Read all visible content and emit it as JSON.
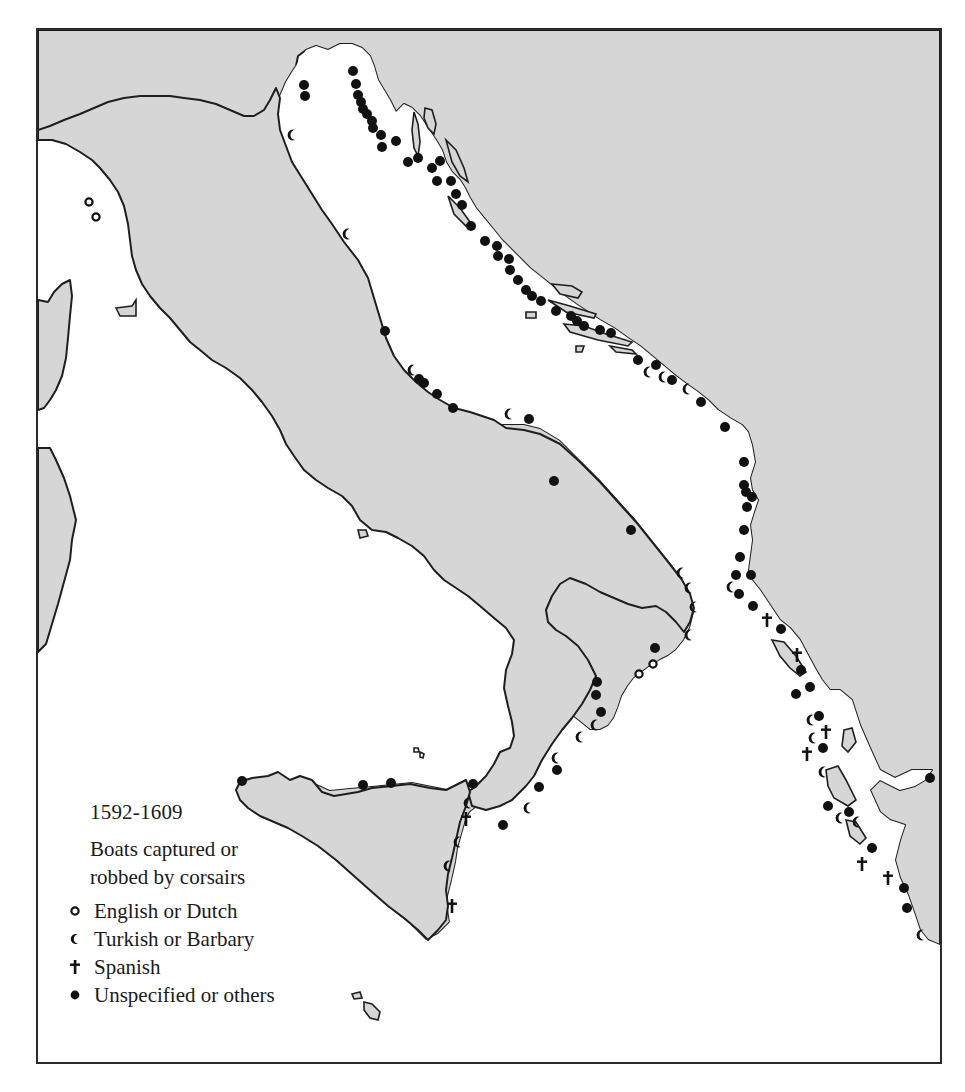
{
  "map": {
    "period": "1592-1609",
    "title_line1": "Boats captured or",
    "title_line2": "robbed by corsairs",
    "colors": {
      "land": "#d6d6d6",
      "sea": "#ffffff",
      "coast": "#1e1e1e",
      "symbol": "#111111"
    }
  },
  "legend": {
    "items": [
      {
        "symbol": "open-circle",
        "label": "English or Dutch"
      },
      {
        "symbol": "crescent",
        "label": "Turkish or Barbary"
      },
      {
        "symbol": "cross",
        "label": "Spanish"
      },
      {
        "symbol": "filled-circle",
        "label": "Unspecified or others"
      }
    ]
  },
  "markers": {
    "english_dutch": [
      [
        89,
        202
      ],
      [
        96,
        217
      ],
      [
        653,
        664
      ],
      [
        639,
        674
      ]
    ],
    "turkish_barbary": [
      [
        291,
        135
      ],
      [
        346,
        234
      ],
      [
        411,
        370
      ],
      [
        508,
        414
      ],
      [
        680,
        573
      ],
      [
        688,
        588
      ],
      [
        693,
        607
      ],
      [
        688,
        635
      ],
      [
        594,
        725
      ],
      [
        579,
        737
      ],
      [
        555,
        758
      ],
      [
        527,
        808
      ],
      [
        467,
        803
      ],
      [
        457,
        842
      ],
      [
        447,
        866
      ],
      [
        647,
        372
      ],
      [
        662,
        377
      ],
      [
        686,
        389
      ],
      [
        810,
        720
      ],
      [
        812,
        738
      ],
      [
        822,
        772
      ],
      [
        839,
        818
      ],
      [
        856,
        822
      ],
      [
        920,
        935
      ],
      [
        730,
        587
      ]
    ],
    "spanish": [
      [
        466,
        819
      ],
      [
        452,
        906
      ],
      [
        767,
        620
      ],
      [
        797,
        655
      ],
      [
        826,
        732
      ],
      [
        807,
        754
      ],
      [
        862,
        864
      ],
      [
        888,
        878
      ]
    ],
    "unspecified": [
      [
        304,
        85
      ],
      [
        305,
        96
      ],
      [
        353,
        71
      ],
      [
        356,
        84
      ],
      [
        358,
        95
      ],
      [
        361,
        102
      ],
      [
        363,
        109
      ],
      [
        367,
        114
      ],
      [
        372,
        121
      ],
      [
        373,
        128
      ],
      [
        381,
        135
      ],
      [
        382,
        147
      ],
      [
        396,
        141
      ],
      [
        408,
        162
      ],
      [
        418,
        158
      ],
      [
        432,
        168
      ],
      [
        440,
        161
      ],
      [
        437,
        181
      ],
      [
        451,
        181
      ],
      [
        456,
        194
      ],
      [
        462,
        205
      ],
      [
        471,
        226
      ],
      [
        485,
        241
      ],
      [
        497,
        246
      ],
      [
        498,
        256
      ],
      [
        509,
        259
      ],
      [
        510,
        270
      ],
      [
        518,
        280
      ],
      [
        526,
        290
      ],
      [
        532,
        296
      ],
      [
        541,
        301
      ],
      [
        556,
        311
      ],
      [
        571,
        316
      ],
      [
        577,
        321
      ],
      [
        584,
        326
      ],
      [
        600,
        330
      ],
      [
        611,
        333
      ],
      [
        638,
        360
      ],
      [
        656,
        365
      ],
      [
        672,
        380
      ],
      [
        701,
        402
      ],
      [
        725,
        427
      ],
      [
        744,
        462
      ],
      [
        744,
        485
      ],
      [
        746,
        492
      ],
      [
        752,
        497
      ],
      [
        747,
        507
      ],
      [
        744,
        530
      ],
      [
        740,
        557
      ],
      [
        736,
        575
      ],
      [
        751,
        575
      ],
      [
        739,
        594
      ],
      [
        753,
        606
      ],
      [
        781,
        629
      ],
      [
        801,
        670
      ],
      [
        796,
        694
      ],
      [
        810,
        687
      ],
      [
        819,
        716
      ],
      [
        823,
        748
      ],
      [
        828,
        806
      ],
      [
        849,
        812
      ],
      [
        872,
        848
      ],
      [
        904,
        888
      ],
      [
        907,
        908
      ],
      [
        930,
        778
      ],
      [
        385,
        331
      ],
      [
        419,
        379
      ],
      [
        424,
        383
      ],
      [
        437,
        394
      ],
      [
        453,
        408
      ],
      [
        529,
        419
      ],
      [
        554,
        481
      ],
      [
        631,
        530
      ],
      [
        655,
        648
      ],
      [
        597,
        682
      ],
      [
        596,
        695
      ],
      [
        601,
        712
      ],
      [
        557,
        770
      ],
      [
        539,
        787
      ],
      [
        503,
        825
      ],
      [
        473,
        784
      ],
      [
        391,
        783
      ],
      [
        363,
        785
      ],
      [
        242,
        781
      ]
    ]
  }
}
